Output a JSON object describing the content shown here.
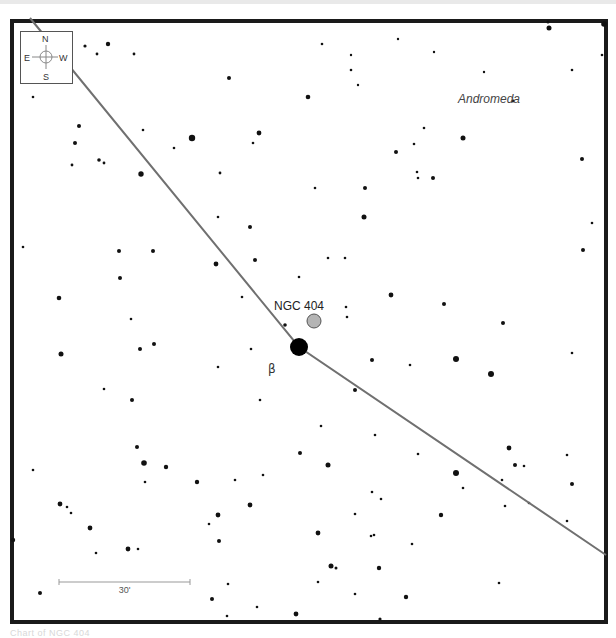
{
  "chart": {
    "constellation_label": "Andromeda",
    "target": {
      "label": "NGC 404",
      "x": 314,
      "y": 321,
      "r": 7,
      "fill": "#b4b4b4"
    },
    "bright_star": {
      "label": "β",
      "x": 299,
      "y": 347,
      "r": 9,
      "label_x": 268,
      "label_y": 373
    },
    "scale_bar": {
      "label": "30'",
      "x1": 59,
      "x2": 190,
      "y": 582
    },
    "frame": {
      "x": 12,
      "y": 21,
      "width": 594,
      "height": 601,
      "border_color": "#1a1a1a"
    },
    "line": {
      "color": "#707070",
      "points": [
        [
          30,
          18
        ],
        [
          299,
          347
        ],
        [
          606,
          555
        ]
      ]
    },
    "compass": {
      "north": "N",
      "south": "S",
      "east": "E",
      "west": "W"
    },
    "stars": [
      [
        85,
        46,
        1.6
      ],
      [
        97,
        54,
        1.4
      ],
      [
        108,
        44,
        2.2
      ],
      [
        134,
        54,
        1.4
      ],
      [
        229,
        78,
        2
      ],
      [
        308,
        97,
        2.3
      ],
      [
        322,
        44,
        1.3
      ],
      [
        351,
        70,
        1.3
      ],
      [
        351,
        55,
        1.2
      ],
      [
        358,
        85,
        1.2
      ],
      [
        398,
        39,
        1.2
      ],
      [
        434,
        52,
        1.2
      ],
      [
        484,
        72,
        1.2
      ],
      [
        513,
        101,
        1.4
      ],
      [
        549,
        28,
        2.5
      ],
      [
        548,
        22,
        1.5
      ],
      [
        572,
        70,
        1.3
      ],
      [
        604,
        24,
        2.8
      ],
      [
        602,
        55,
        1.3
      ],
      [
        33,
        97,
        1.3
      ],
      [
        79,
        126,
        2
      ],
      [
        75,
        143,
        2
      ],
      [
        72,
        165,
        1.4
      ],
      [
        99,
        160,
        1.8
      ],
      [
        104,
        163,
        1.4
      ],
      [
        141,
        174,
        2.7
      ],
      [
        143,
        130,
        1.3
      ],
      [
        174,
        148,
        1.3
      ],
      [
        192,
        138,
        3.2
      ],
      [
        220,
        173,
        1.4
      ],
      [
        259,
        133,
        2.4
      ],
      [
        253,
        143,
        1.3
      ],
      [
        424,
        128,
        1.3
      ],
      [
        414,
        144,
        1.3
      ],
      [
        396,
        152,
        2
      ],
      [
        417,
        172,
        1.3
      ],
      [
        463,
        138,
        2.5
      ],
      [
        582,
        159,
        2
      ],
      [
        592,
        223,
        1.3
      ],
      [
        583,
        250,
        2
      ],
      [
        418,
        178,
        1.3
      ],
      [
        433,
        178,
        2
      ],
      [
        23,
        247,
        1.3
      ],
      [
        119,
        251,
        2
      ],
      [
        153,
        251,
        2
      ],
      [
        120,
        278,
        2
      ],
      [
        59,
        298,
        2.3
      ],
      [
        216,
        264,
        2.4
      ],
      [
        255,
        260,
        2
      ],
      [
        218,
        217,
        1.3
      ],
      [
        250,
        227,
        2
      ],
      [
        315,
        188,
        1.3
      ],
      [
        365,
        188,
        2
      ],
      [
        364,
        217,
        2.5
      ],
      [
        328,
        258,
        1.3
      ],
      [
        345,
        258,
        1.3
      ],
      [
        299,
        277,
        1.3
      ],
      [
        242,
        297,
        1.3
      ],
      [
        391,
        295,
        2.4
      ],
      [
        444,
        304,
        2
      ],
      [
        503,
        323,
        2
      ],
      [
        131,
        319,
        1.3
      ],
      [
        154,
        344,
        2
      ],
      [
        140,
        349,
        2
      ],
      [
        285,
        325,
        1.8
      ],
      [
        346,
        307,
        1.3
      ],
      [
        347,
        317,
        1.3
      ],
      [
        61,
        354,
        2.5
      ],
      [
        104,
        389,
        1.3
      ],
      [
        132,
        400,
        2
      ],
      [
        218,
        367,
        1.3
      ],
      [
        251,
        349,
        1.3
      ],
      [
        372,
        360,
        2
      ],
      [
        410,
        365,
        1.3
      ],
      [
        456,
        359,
        3
      ],
      [
        491,
        374,
        3
      ],
      [
        572,
        353,
        1.3
      ],
      [
        355,
        390,
        2
      ],
      [
        260,
        400,
        1.3
      ],
      [
        321,
        426,
        1.3
      ],
      [
        375,
        435,
        1.3
      ],
      [
        418,
        454,
        1.3
      ],
      [
        137,
        447,
        2
      ],
      [
        144,
        463,
        2.8
      ],
      [
        166,
        467,
        2.2
      ],
      [
        145,
        482,
        1.3
      ],
      [
        197,
        482,
        2.2
      ],
      [
        235,
        480,
        1.3
      ],
      [
        263,
        475,
        1.3
      ],
      [
        33,
        470,
        1.3
      ],
      [
        60,
        504,
        2.4
      ],
      [
        67,
        507,
        1.3
      ],
      [
        71,
        513,
        1.3
      ],
      [
        90,
        528,
        2.4
      ],
      [
        96,
        553,
        1.3
      ],
      [
        128,
        549,
        2.4
      ],
      [
        138,
        549,
        1.3
      ],
      [
        209,
        524,
        1.3
      ],
      [
        218,
        515,
        2.4
      ],
      [
        219,
        541,
        2
      ],
      [
        250,
        505,
        2.4
      ],
      [
        328,
        465,
        2.5
      ],
      [
        300,
        453,
        2
      ],
      [
        456,
        473,
        3
      ],
      [
        463,
        488,
        1.3
      ],
      [
        515,
        465,
        2
      ],
      [
        524,
        466,
        1.3
      ],
      [
        509,
        448,
        2.4
      ],
      [
        567,
        455,
        1.3
      ],
      [
        572,
        484,
        2
      ],
      [
        567,
        521,
        1.3
      ],
      [
        529,
        503,
        1.3
      ],
      [
        502,
        480,
        1.3
      ],
      [
        505,
        506,
        1.3
      ],
      [
        372,
        492,
        1.3
      ],
      [
        381,
        499,
        1.3
      ],
      [
        355,
        514,
        1.3
      ],
      [
        441,
        515,
        2.2
      ],
      [
        318,
        533,
        2.4
      ],
      [
        371,
        536,
        1.3
      ],
      [
        374,
        535,
        1.3
      ],
      [
        331,
        566,
        2.5
      ],
      [
        336,
        568,
        1.5
      ],
      [
        318,
        582,
        1.3
      ],
      [
        379,
        568,
        2.2
      ],
      [
        355,
        594,
        1.3
      ],
      [
        406,
        597,
        2.2
      ],
      [
        499,
        583,
        1.3
      ],
      [
        412,
        544,
        1.3
      ],
      [
        40,
        593,
        2
      ],
      [
        212,
        599,
        2
      ],
      [
        227,
        616,
        1.3
      ],
      [
        257,
        607,
        1.3
      ],
      [
        296,
        614,
        2.4
      ],
      [
        380,
        619,
        1.6
      ],
      [
        13,
        540,
        2.2
      ],
      [
        228,
        584,
        1.3
      ]
    ]
  },
  "caption": "Chart of NGC 404"
}
